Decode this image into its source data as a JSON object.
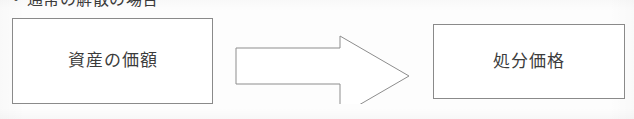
{
  "document": {
    "language": "ja",
    "heading": {
      "bullet": "・",
      "text": "通常の解散の場合"
    }
  },
  "diagram": {
    "type": "flow",
    "direction": "left-to-right",
    "nodes": [
      {
        "id": "assets",
        "label": "資産の価額",
        "shape": "rectangle"
      },
      {
        "id": "disposal",
        "label": "処分価格",
        "shape": "rectangle"
      }
    ],
    "connector": {
      "id": "arrow",
      "shape": "block-arrow",
      "from": "assets",
      "to": "disposal",
      "label": ""
    }
  },
  "colors": {
    "page_background": "#fdfdfd",
    "box_fill": "#ffffff",
    "box_stroke": "#8a8a8a",
    "arrow_fill": "#ffffff",
    "arrow_stroke": "#8d8d8d",
    "text": "#3c3c3c",
    "heading_text": "#3a3a3a"
  }
}
